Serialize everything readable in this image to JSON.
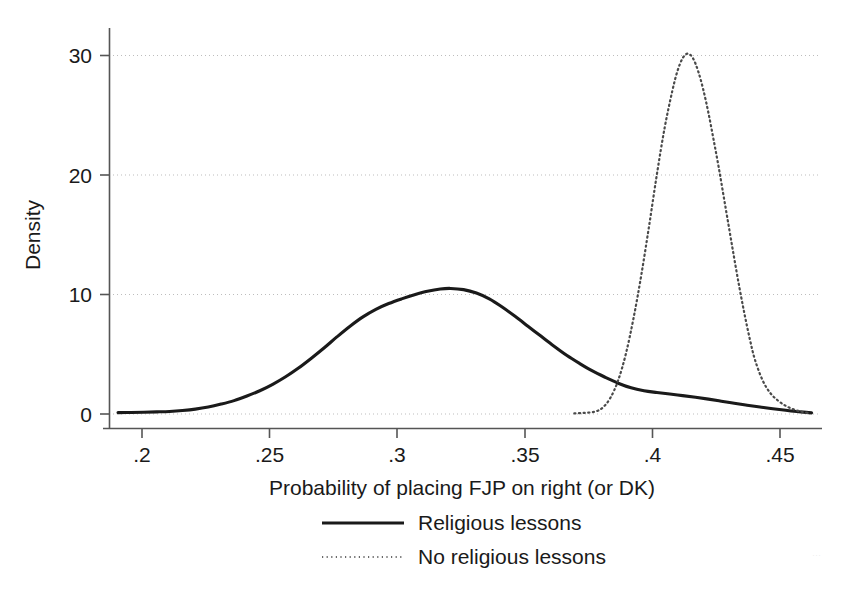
{
  "chart_data": {
    "type": "line",
    "title": "",
    "subtitle": "",
    "xlabel": "Probability of placing FJP on right (or DK)",
    "ylabel": "Density",
    "xlim": [
      0.1895,
      0.4645
    ],
    "ylim": [
      0,
      33.2
    ],
    "xticks": [
      0.2,
      0.25,
      0.3,
      0.35,
      0.4,
      0.45
    ],
    "xticklabels": [
      ".2",
      ".25",
      ".3",
      ".35",
      ".4",
      ".45"
    ],
    "yticks": [
      0,
      10,
      20,
      30
    ],
    "yticklabels": [
      "0",
      "10",
      "20",
      "30"
    ],
    "grid": "horizontal-dotted",
    "legend_position": "below-axis-title",
    "series": [
      {
        "name": "Religious lessons",
        "style": "solid",
        "color": "#1a1a1a",
        "x": [
          0.193,
          0.198,
          0.203,
          0.208,
          0.213,
          0.218,
          0.223,
          0.228,
          0.233,
          0.238,
          0.243,
          0.248,
          0.253,
          0.258,
          0.263,
          0.268,
          0.273,
          0.278,
          0.283,
          0.288,
          0.293,
          0.298,
          0.303,
          0.308,
          0.313,
          0.318,
          0.322,
          0.327,
          0.332,
          0.337,
          0.342,
          0.347,
          0.352,
          0.357,
          0.362,
          0.367,
          0.372,
          0.377,
          0.382,
          0.387,
          0.392,
          0.397,
          0.402,
          0.407,
          0.412,
          0.417,
          0.422,
          0.427,
          0.432,
          0.437,
          0.442,
          0.447,
          0.452,
          0.457,
          0.462
        ],
        "y": [
          0.12,
          0.13,
          0.15,
          0.18,
          0.22,
          0.3,
          0.42,
          0.6,
          0.85,
          1.15,
          1.55,
          2.0,
          2.55,
          3.2,
          3.95,
          4.8,
          5.7,
          6.65,
          7.55,
          8.35,
          9.0,
          9.5,
          9.9,
          10.25,
          10.55,
          10.75,
          10.8,
          10.7,
          10.4,
          9.9,
          9.2,
          8.4,
          7.55,
          6.7,
          5.85,
          5.05,
          4.35,
          3.7,
          3.15,
          2.65,
          2.25,
          2.0,
          1.85,
          1.72,
          1.58,
          1.44,
          1.28,
          1.1,
          0.92,
          0.75,
          0.6,
          0.45,
          0.32,
          0.2,
          0.1
        ]
      },
      {
        "name": "No religious lessons",
        "style": "dotted",
        "color": "#4a4a4a",
        "x": [
          0.37,
          0.374,
          0.378,
          0.381,
          0.384,
          0.387,
          0.39,
          0.393,
          0.396,
          0.399,
          0.402,
          0.405,
          0.408,
          0.41,
          0.412,
          0.414,
          0.416,
          0.418,
          0.42,
          0.422,
          0.424,
          0.426,
          0.428,
          0.43,
          0.432,
          0.434,
          0.436,
          0.438,
          0.44,
          0.443,
          0.446,
          0.449,
          0.452,
          0.455,
          0.458,
          0.461
        ],
        "y": [
          0.05,
          0.1,
          0.2,
          0.55,
          1.4,
          2.9,
          5.2,
          8.3,
          12.0,
          16.2,
          20.6,
          24.6,
          27.8,
          29.5,
          30.6,
          31.0,
          30.6,
          29.5,
          27.9,
          25.9,
          23.6,
          21.2,
          18.6,
          16.0,
          13.4,
          10.9,
          8.6,
          6.5,
          4.7,
          2.9,
          1.8,
          1.15,
          0.7,
          0.4,
          0.2,
          0.08
        ]
      }
    ],
    "legend": [
      {
        "label": "Religious lessons",
        "style": "solid"
      },
      {
        "label": "No religious lessons",
        "style": "dotted"
      }
    ]
  }
}
